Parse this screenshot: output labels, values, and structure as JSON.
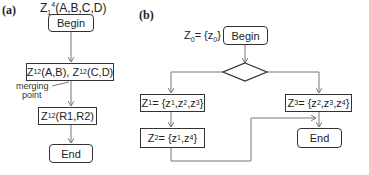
{
  "panel_a": {
    "label": "(a)",
    "title": {
      "base": "Z",
      "sub": "1",
      "sup": "4",
      "rest": "(A,B,C,D)"
    },
    "begin": "Begin",
    "split_box": {
      "p1_base": "Z",
      "p1_sub": "1",
      "p1_sup": "2",
      "p1_rest": "(A,B), ",
      "p2_base": "Z",
      "p2_sub": "1",
      "p2_sup": "2",
      "p2_rest": "(C,D)"
    },
    "merging_label_1": "merging",
    "merging_label_2": "point",
    "merge_box": {
      "base": "Z",
      "sub": "1",
      "sup": "2",
      "rest": "(R1,R2)"
    },
    "end": "End"
  },
  "panel_b": {
    "label": "(b)",
    "z0": {
      "base": "Z",
      "sub": "0",
      "mid": "= {z",
      "sub2": "0",
      "end": "}"
    },
    "begin": "Begin",
    "z1": {
      "base": "Z",
      "sub": "1",
      "text": "= {z",
      "s1": "1",
      "c1": ",z",
      "s2": "2",
      "c2": ",z",
      "s3": "3",
      "end": "}"
    },
    "z2": {
      "base": "Z",
      "sub": "2",
      "text": "= {z",
      "s1": "1",
      "c1": ",z",
      "s2": "4",
      "end": "}"
    },
    "z3": {
      "base": "Z",
      "sub": "3",
      "text": "= {z",
      "s1": "2",
      "c1": ",z",
      "s2": "3",
      "c2": ",z",
      "s3": "4",
      "end": "}"
    },
    "end": "End"
  },
  "colors": {
    "stroke": "#333333",
    "arrow": "#777777"
  }
}
